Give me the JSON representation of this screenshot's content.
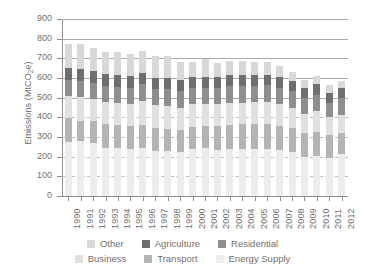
{
  "chart_data": {
    "type": "bar",
    "stacked": true,
    "title": "",
    "subtitle": "",
    "xlabel": "",
    "ylabel": "Emissions (MtCO2e)",
    "ylabel_parts": {
      "pre": "Emissions (MtCO",
      "sub": "2",
      "post": "e)"
    },
    "ylim": [
      0,
      900
    ],
    "ytick_step": 100,
    "yticks": [
      0,
      100,
      200,
      300,
      400,
      500,
      600,
      700,
      800,
      900
    ],
    "grid": true,
    "grid_note": "solid gridlines above 400, dashed gridlines at 100/200/300/400",
    "legend_position": "bottom",
    "categories": [
      "1990",
      "1991",
      "1992",
      "1993",
      "1994",
      "1995",
      "1996",
      "1997",
      "1998",
      "1999",
      "2000",
      "2001",
      "2002",
      "2003",
      "2004",
      "2005",
      "2006",
      "2007",
      "2008",
      "2009",
      "2010",
      "2011",
      "2012"
    ],
    "series": [
      {
        "name": "Energy Supply",
        "color": "#ececec",
        "values": [
          277,
          282,
          268,
          245,
          245,
          238,
          242,
          228,
          230,
          222,
          240,
          243,
          234,
          241,
          239,
          238,
          240,
          232,
          224,
          200,
          206,
          191,
          213
        ]
      },
      {
        "name": "Transport",
        "color": "#b4b4b4",
        "values": [
          121,
          100,
          114,
          121,
          115,
          119,
          120,
          117,
          112,
          116,
          113,
          112,
          120,
          122,
          126,
          126,
          127,
          123,
          120,
          118,
          118,
          118,
          107
        ]
      },
      {
        "name": "Business",
        "color": "#e0e0e0",
        "values": [
          111,
          122,
          112,
          112,
          114,
          112,
          120,
          116,
          114,
          112,
          113,
          112,
          113,
          112,
          110,
          112,
          113,
          112,
          106,
          100,
          107,
          92,
          94
        ]
      },
      {
        "name": "Residential",
        "color": "#8e8e8e",
        "values": [
          81,
          81,
          81,
          81,
          82,
          82,
          86,
          85,
          86,
          84,
          84,
          84,
          84,
          84,
          84,
          85,
          84,
          82,
          82,
          80,
          85,
          73,
          82
        ]
      },
      {
        "name": "Agriculture",
        "color": "#6e6e6e",
        "values": [
          60,
          59,
          59,
          60,
          59,
          58,
          58,
          56,
          56,
          56,
          56,
          55,
          55,
          55,
          55,
          54,
          54,
          54,
          53,
          52,
          52,
          52,
          52
        ]
      },
      {
        "name": "Other",
        "color": "#d8d8d8",
        "values": [
          123,
          130,
          121,
          113,
          118,
          112,
          114,
          111,
          116,
          94,
          78,
          89,
          70,
          73,
          75,
          67,
          64,
          57,
          47,
          42,
          40,
          37,
          38
        ]
      }
    ]
  },
  "legend": {
    "rows": [
      [
        {
          "label": "Other",
          "color": "#d8d8d8"
        },
        {
          "label": "Agriculture",
          "color": "#6e6e6e"
        },
        {
          "label": "Residential",
          "color": "#8e8e8e"
        }
      ],
      [
        {
          "label": "Business",
          "color": "#e0e0e0"
        },
        {
          "label": "Transport",
          "color": "#b4b4b4"
        },
        {
          "label": "Energy Supply",
          "color": "#ececec"
        }
      ]
    ]
  }
}
